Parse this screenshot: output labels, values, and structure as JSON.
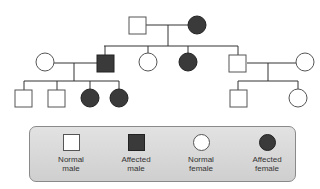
{
  "diagram": {
    "type": "pedigree",
    "colors": {
      "affected": "#3a3a3a",
      "normal": "#ffffff",
      "line": "#333333",
      "legend_bg": "#d8d8d8"
    },
    "generations": [
      {
        "id": "I",
        "individuals": [
          {
            "id": "I-1",
            "sex": "male",
            "affected": false
          },
          {
            "id": "I-2",
            "sex": "female",
            "affected": true
          }
        ]
      },
      {
        "id": "II",
        "individuals": [
          {
            "id": "II-spouse-1",
            "sex": "female",
            "affected": false,
            "married_in": true
          },
          {
            "id": "II-1",
            "sex": "male",
            "affected": true
          },
          {
            "id": "II-2",
            "sex": "female",
            "affected": false
          },
          {
            "id": "II-3",
            "sex": "female",
            "affected": true
          },
          {
            "id": "II-4",
            "sex": "male",
            "affected": false
          },
          {
            "id": "II-spouse-2",
            "sex": "female",
            "affected": false,
            "married_in": true
          }
        ]
      },
      {
        "id": "III",
        "individuals": [
          {
            "id": "III-1",
            "sex": "male",
            "affected": false,
            "parents": "II-1"
          },
          {
            "id": "III-2",
            "sex": "male",
            "affected": false,
            "parents": "II-1"
          },
          {
            "id": "III-3",
            "sex": "female",
            "affected": true,
            "parents": "II-1"
          },
          {
            "id": "III-4",
            "sex": "female",
            "affected": true,
            "parents": "II-1"
          },
          {
            "id": "III-5",
            "sex": "male",
            "affected": false,
            "parents": "II-4"
          },
          {
            "id": "III-6",
            "sex": "female",
            "affected": false,
            "parents": "II-4"
          }
        ]
      }
    ]
  },
  "legend": {
    "items": [
      {
        "symbol": "square-open",
        "line1": "Normal",
        "line2": "male"
      },
      {
        "symbol": "square-filled",
        "line1": "Affected",
        "line2": "male"
      },
      {
        "symbol": "circle-open",
        "line1": "Normal",
        "line2": "female"
      },
      {
        "symbol": "circle-filled",
        "line1": "Affected",
        "line2": "female"
      }
    ]
  }
}
